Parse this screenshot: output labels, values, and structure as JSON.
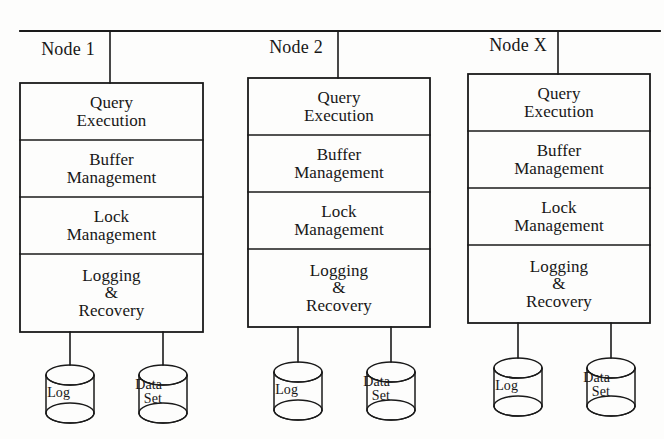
{
  "diagram": {
    "type": "block-diagram",
    "background_color": "#fdfdfc",
    "line_color": "#1a1a1a",
    "text_color": "#171717",
    "interconnect": {
      "name": "network-bus",
      "orientation": "horizontal",
      "y": 31,
      "x_start": 20,
      "x_end": 660
    },
    "nodes": [
      {
        "id": "node-1",
        "title": "Node 1",
        "box": {
          "x": 20,
          "y": 83,
          "width": 183,
          "height": 249
        },
        "title_pos": {
          "x": 26,
          "y": 40
        },
        "drop_line_x": 110,
        "layers": [
          {
            "id": "query-execution",
            "lines": [
              "Query",
              "Execution"
            ]
          },
          {
            "id": "buffer-management",
            "lines": [
              "Buffer",
              "Management"
            ]
          },
          {
            "id": "lock-management",
            "lines": [
              "Lock",
              "Management"
            ]
          },
          {
            "id": "logging-recovery",
            "lines": [
              "Logging",
              "&",
              "Recovery"
            ]
          }
        ],
        "stores": [
          {
            "id": "log-store",
            "label": "Log",
            "label_lines": [
              "Log"
            ],
            "cx": 70,
            "cy": 394,
            "stem_x": 70,
            "label_x": 18,
            "label_y": 386
          },
          {
            "id": "data-set-store",
            "label": "Data Set",
            "label_lines": [
              "Data",
              "Set"
            ],
            "cx": 163,
            "cy": 394,
            "stem_x": 163,
            "label_x": 110,
            "label_y": 378
          }
        ]
      },
      {
        "id": "node-2",
        "title": "Node 2",
        "box": {
          "x": 248,
          "y": 78,
          "width": 182,
          "height": 249
        },
        "title_pos": {
          "x": 254,
          "y": 38
        },
        "drop_line_x": 338,
        "layers": [
          {
            "id": "query-execution",
            "lines": [
              "Query",
              "Execution"
            ]
          },
          {
            "id": "buffer-management",
            "lines": [
              "Buffer",
              "Management"
            ]
          },
          {
            "id": "lock-management",
            "lines": [
              "Lock",
              "Management"
            ]
          },
          {
            "id": "logging-recovery",
            "lines": [
              "Logging",
              "&",
              "Recovery"
            ]
          }
        ],
        "stores": [
          {
            "id": "log-store",
            "label": "Log",
            "label_lines": [
              "Log"
            ],
            "cx": 298,
            "cy": 391,
            "stem_x": 298,
            "label_x": 246,
            "label_y": 383
          },
          {
            "id": "data-set-store",
            "label": "Data Set",
            "label_lines": [
              "Data",
              "Set"
            ],
            "cx": 391,
            "cy": 391,
            "stem_x": 391,
            "label_x": 338,
            "label_y": 375
          }
        ]
      },
      {
        "id": "node-x",
        "title": "Node X",
        "box": {
          "x": 468,
          "y": 74,
          "width": 182,
          "height": 249
        },
        "title_pos": {
          "x": 476,
          "y": 36
        },
        "drop_line_x": 558,
        "layers": [
          {
            "id": "query-execution",
            "lines": [
              "Query",
              "Execution"
            ]
          },
          {
            "id": "buffer-management",
            "lines": [
              "Buffer",
              "Management"
            ]
          },
          {
            "id": "lock-management",
            "lines": [
              "Lock",
              "Management"
            ]
          },
          {
            "id": "logging-recovery",
            "lines": [
              "Logging",
              "&",
              "Recovery"
            ]
          }
        ],
        "stores": [
          {
            "id": "log-store",
            "label": "Log",
            "label_lines": [
              "Log"
            ],
            "cx": 518,
            "cy": 387,
            "stem_x": 518,
            "label_x": 466,
            "label_y": 379
          },
          {
            "id": "data-set-store",
            "label": "Data Set",
            "label_lines": [
              "Data",
              "Set"
            ],
            "cx": 611,
            "cy": 387,
            "stem_x": 611,
            "label_x": 558,
            "label_y": 371
          }
        ]
      }
    ],
    "layer_row_heights": [
      57,
      57,
      57,
      78
    ],
    "cylinder": {
      "rx": 24,
      "ry": 10,
      "body_height": 38
    }
  }
}
